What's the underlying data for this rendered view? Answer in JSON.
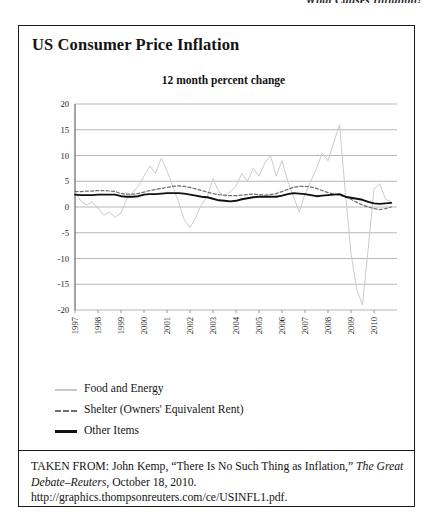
{
  "page": {
    "running_header": "What Causes Inflation?"
  },
  "figure": {
    "title": "US Consumer Price Inflation",
    "subtitle": "12 month percent change",
    "legend": [
      {
        "label": "Food and Energy",
        "style": "solid",
        "color": "#c8c8c8"
      },
      {
        "label": "Shelter (Owners' Equivalent Rent)",
        "style": "dashed",
        "color": "#6e6e6e"
      },
      {
        "label": "Other Items",
        "style": "solid",
        "color": "#111111"
      }
    ],
    "citation": {
      "prefix": "TAKEN FROM: John Kemp, “There Is No Such Thing as Inflation,” ",
      "publication": "The Great Debate–Reuters",
      "suffix": ", October 18, 2010. http://graphics.thompsonreuters.com/ce/USINFL1.pdf."
    }
  },
  "chart_data": {
    "type": "line",
    "title": "US Consumer Price Inflation",
    "subtitle": "12 month percent change",
    "xlabel": "",
    "ylabel": "",
    "ylim": [
      -20,
      20
    ],
    "yticks": [
      20,
      15,
      10,
      5,
      0,
      -5,
      -10,
      -15,
      -20
    ],
    "grid": true,
    "legend_position": "below",
    "xlim": [
      1997,
      2011
    ],
    "xticks": [
      1997,
      1998,
      1999,
      2000,
      2001,
      2002,
      2003,
      2004,
      2005,
      2006,
      2007,
      2008,
      2009,
      2010
    ],
    "x": [
      1997.0,
      1997.25,
      1997.5,
      1997.75,
      1998.0,
      1998.25,
      1998.5,
      1998.75,
      1999.0,
      1999.25,
      1999.5,
      1999.75,
      2000.0,
      2000.25,
      2000.5,
      2000.75,
      2001.0,
      2001.25,
      2001.5,
      2001.75,
      2002.0,
      2002.25,
      2002.5,
      2002.75,
      2003.0,
      2003.25,
      2003.5,
      2003.75,
      2004.0,
      2004.25,
      2004.5,
      2004.75,
      2005.0,
      2005.25,
      2005.5,
      2005.75,
      2006.0,
      2006.25,
      2006.5,
      2006.75,
      2007.0,
      2007.25,
      2007.5,
      2007.75,
      2008.0,
      2008.25,
      2008.5,
      2008.75,
      2009.0,
      2009.25,
      2009.5,
      2009.75,
      2010.0,
      2010.25,
      2010.5,
      2010.75
    ],
    "series": [
      {
        "name": "Food and Energy",
        "color": "#c8c8c8",
        "style": "solid",
        "values": [
          3.0,
          1.2,
          0.4,
          1.0,
          -0.2,
          -1.6,
          -1.0,
          -2.0,
          -1.2,
          1.6,
          2.8,
          4.0,
          6.0,
          8.0,
          6.5,
          9.5,
          7.0,
          4.0,
          1.0,
          -2.5,
          -4.0,
          -2.0,
          0.5,
          2.0,
          5.5,
          3.0,
          2.0,
          3.0,
          4.0,
          6.5,
          5.0,
          7.5,
          6.0,
          8.5,
          10.0,
          6.0,
          9.0,
          5.0,
          2.0,
          -1.0,
          2.5,
          5.0,
          7.5,
          10.5,
          9.0,
          12.5,
          16.0,
          3.0,
          -9.0,
          -16.0,
          -19.0,
          -8.0,
          3.5,
          4.5,
          1.5,
          1.0
        ]
      },
      {
        "name": "Shelter (Owners' Equivalent Rent)",
        "color": "#6e6e6e",
        "style": "dashed",
        "values": [
          3.0,
          3.0,
          3.1,
          3.1,
          3.2,
          3.2,
          3.1,
          3.0,
          2.6,
          2.5,
          2.5,
          2.6,
          2.9,
          3.2,
          3.4,
          3.6,
          3.8,
          4.0,
          4.1,
          4.0,
          3.8,
          3.5,
          3.2,
          2.9,
          2.6,
          2.4,
          2.3,
          2.2,
          2.2,
          2.3,
          2.4,
          2.5,
          2.4,
          2.3,
          2.4,
          2.6,
          3.0,
          3.4,
          3.8,
          4.0,
          4.0,
          3.9,
          3.6,
          3.2,
          2.8,
          2.5,
          2.3,
          2.0,
          1.5,
          0.9,
          0.4,
          0.0,
          -0.3,
          -0.5,
          -0.3,
          0.0
        ]
      },
      {
        "name": "Other Items",
        "color": "#111111",
        "style": "solid",
        "values": [
          2.4,
          2.3,
          2.3,
          2.3,
          2.4,
          2.4,
          2.4,
          2.4,
          2.1,
          2.0,
          2.0,
          2.1,
          2.4,
          2.5,
          2.5,
          2.6,
          2.7,
          2.7,
          2.7,
          2.6,
          2.4,
          2.2,
          2.0,
          1.9,
          1.6,
          1.3,
          1.2,
          1.1,
          1.2,
          1.5,
          1.7,
          1.9,
          2.0,
          2.0,
          2.0,
          2.0,
          2.2,
          2.5,
          2.7,
          2.6,
          2.5,
          2.3,
          2.1,
          2.2,
          2.3,
          2.4,
          2.5,
          2.0,
          1.8,
          1.6,
          1.4,
          1.0,
          0.7,
          0.6,
          0.7,
          0.8
        ]
      }
    ]
  }
}
